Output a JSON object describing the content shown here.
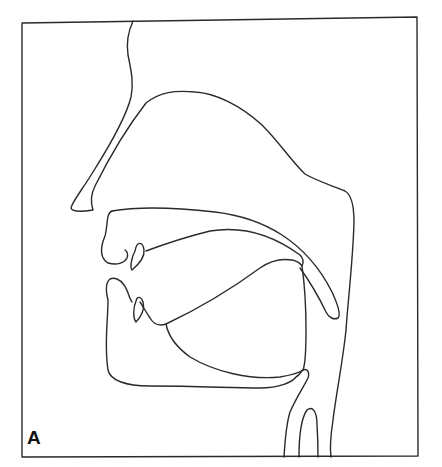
{
  "figure": {
    "panel_label": "A",
    "line_color": "#2a2a2a",
    "background": "#ffffff"
  }
}
